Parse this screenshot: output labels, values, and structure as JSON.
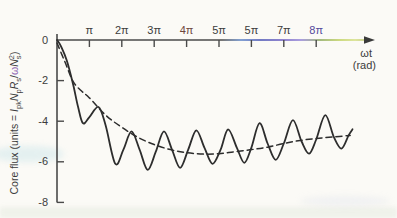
{
  "figure": {
    "background": "#fbfaf6",
    "curve_color": "#2d2d2d",
    "axis_color": "#4a4a4a",
    "arrow_color": "#3a3a3a",
    "text_color": "#3c3c3c",
    "omega_accent_color": "#8a5fb0"
  },
  "chart_data": {
    "type": "line",
    "title": "",
    "xlabel": "ωt (rad)",
    "ylabel": "Core flux (units = IpkNpRs/ωNs²)",
    "ylabel_parts": [
      {
        "t": "Core flux (units = "
      },
      {
        "t": "I",
        "it": true
      },
      {
        "t": "pk",
        "sub": true
      },
      {
        "t": "N",
        "it": true
      },
      {
        "t": "p",
        "sub": true
      },
      {
        "t": "R",
        "it": true
      },
      {
        "t": "s",
        "sub": true
      },
      {
        "t": "/"
      },
      {
        "t": "ω",
        "accent": true
      },
      {
        "t": "N",
        "it": true
      },
      {
        "t": "s",
        "sub": true
      },
      {
        "t": "2",
        "sup": true
      },
      {
        "t": ")"
      }
    ],
    "legend": "none",
    "grid": false,
    "x_axis": {
      "title_line1": "ωt",
      "title_line2": "(rad)",
      "units": "radians, ticks at multiples of π",
      "xlim_pi": [
        0,
        9.8
      ],
      "ticks": [
        {
          "label": "π",
          "pi": 1,
          "color": "#3c3c3c"
        },
        {
          "label": "2π",
          "pi": 2,
          "color": "#3c3c3c"
        },
        {
          "label": "3π",
          "pi": 3,
          "color": "#3c3c3c"
        },
        {
          "label": "4π",
          "pi": 4,
          "color": "#6e463c"
        },
        {
          "label": "5π",
          "pi": 5,
          "color": "#3c3c3c"
        },
        {
          "label": "5π",
          "pi": 6,
          "color": "#3c3c3c"
        },
        {
          "label": "7π",
          "pi": 7,
          "color": "#3c3c3c"
        },
        {
          "label": "8π",
          "pi": 8,
          "color": "#53489b"
        }
      ],
      "scan_tint_stops": [
        {
          "offset": "0%",
          "color": "#4a4a4a"
        },
        {
          "offset": "52%",
          "color": "#4a4a4a"
        },
        {
          "offset": "58%",
          "color": "#5a82c6"
        },
        {
          "offset": "64%",
          "color": "#4450b2"
        },
        {
          "offset": "71%",
          "color": "#6a5ac0"
        },
        {
          "offset": "77%",
          "color": "#8f7fd6"
        },
        {
          "offset": "83%",
          "color": "#86a457"
        },
        {
          "offset": "89%",
          "color": "#bcce58"
        },
        {
          "offset": "94%",
          "color": "#d3de7e"
        },
        {
          "offset": "100%",
          "color": "#a9b468"
        }
      ]
    },
    "y_axis": {
      "ylim": [
        -8,
        0
      ],
      "ticks": [
        {
          "label": "0",
          "value": 0
        },
        {
          "label": "-2",
          "value": -2
        },
        {
          "label": "-4",
          "value": -4
        },
        {
          "label": "-6",
          "value": -6
        },
        {
          "label": "-8",
          "value": -8
        }
      ]
    },
    "series": [
      {
        "name": "instantaneous core flux",
        "line_style": "solid",
        "points_x_in_pi_y_in_flux_units": [
          [
            0,
            0
          ],
          [
            0.12,
            -0.3
          ],
          [
            0.3,
            -1.0
          ],
          [
            0.5,
            -2.2
          ],
          [
            0.65,
            -3.3
          ],
          [
            0.8,
            -4.1
          ],
          [
            1.0,
            -3.8
          ],
          [
            1.28,
            -3.3
          ],
          [
            1.5,
            -4.2
          ],
          [
            1.8,
            -6.1
          ],
          [
            2.05,
            -5.4
          ],
          [
            2.3,
            -4.5
          ],
          [
            2.55,
            -5.4
          ],
          [
            2.8,
            -6.4
          ],
          [
            3.05,
            -5.5
          ],
          [
            3.3,
            -4.5
          ],
          [
            3.55,
            -5.4
          ],
          [
            3.8,
            -6.3
          ],
          [
            4.05,
            -5.4
          ],
          [
            4.3,
            -4.45
          ],
          [
            4.55,
            -5.3
          ],
          [
            4.8,
            -6.1
          ],
          [
            5.05,
            -5.4
          ],
          [
            5.28,
            -4.4
          ],
          [
            5.55,
            -5.3
          ],
          [
            5.78,
            -6.05
          ],
          [
            6.0,
            -5.3
          ],
          [
            6.25,
            -4.1
          ],
          [
            6.5,
            -5.1
          ],
          [
            6.75,
            -5.9
          ],
          [
            7.0,
            -5.1
          ],
          [
            7.28,
            -3.95
          ],
          [
            7.55,
            -5.0
          ],
          [
            7.78,
            -5.6
          ],
          [
            8.0,
            -4.9
          ],
          [
            8.28,
            -3.7
          ],
          [
            8.55,
            -4.8
          ],
          [
            8.78,
            -5.35
          ],
          [
            9.0,
            -4.7
          ],
          [
            9.12,
            -4.4
          ]
        ]
      },
      {
        "name": "average core flux",
        "line_style": "dashed",
        "points_x_in_pi_y_in_flux_units": [
          [
            0,
            -0.15
          ],
          [
            0.25,
            -1.1
          ],
          [
            0.5,
            -2.05
          ],
          [
            0.75,
            -2.5
          ],
          [
            1.0,
            -2.85
          ],
          [
            1.5,
            -3.7
          ],
          [
            2.0,
            -4.3
          ],
          [
            2.5,
            -4.8
          ],
          [
            3.0,
            -5.15
          ],
          [
            3.5,
            -5.4
          ],
          [
            4.0,
            -5.55
          ],
          [
            4.5,
            -5.62
          ],
          [
            5.0,
            -5.6
          ],
          [
            5.5,
            -5.5
          ],
          [
            6.0,
            -5.4
          ],
          [
            6.5,
            -5.28
          ],
          [
            7.0,
            -5.1
          ],
          [
            7.5,
            -4.95
          ],
          [
            8.0,
            -4.85
          ],
          [
            8.5,
            -4.78
          ],
          [
            9.05,
            -4.7
          ]
        ]
      }
    ]
  }
}
